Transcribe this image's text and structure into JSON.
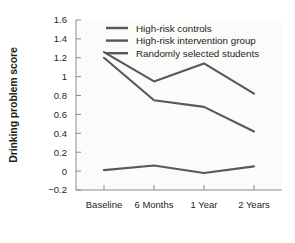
{
  "chart_data": {
    "type": "line",
    "title": "",
    "xlabel": "",
    "ylabel": "Drinking problem score",
    "categories": [
      "Baseline",
      "6 Months",
      "1 Year",
      "2 Years"
    ],
    "ylim": [
      -0.2,
      1.6
    ],
    "ytick_labels": [
      "1.6",
      "1.4",
      "1.2",
      "1",
      "0.8",
      "0.6",
      "0.4",
      "0.2",
      "0",
      "−0.2"
    ],
    "ytick_values": [
      1.6,
      1.4,
      1.2,
      1.0,
      0.8,
      0.6,
      0.4,
      0.2,
      0,
      -0.2
    ],
    "grid": false,
    "legend_position": "top-center",
    "series": [
      {
        "name": "High-risk controls",
        "color": "#56585a",
        "values": [
          1.26,
          0.95,
          1.14,
          0.82
        ]
      },
      {
        "name": "High-risk intervention group",
        "color": "#56585a",
        "values": [
          1.2,
          0.75,
          0.68,
          0.42
        ]
      },
      {
        "name": "Randomly selected students",
        "color": "#56585a",
        "values": [
          0.01,
          0.06,
          -0.02,
          0.05
        ]
      }
    ]
  }
}
